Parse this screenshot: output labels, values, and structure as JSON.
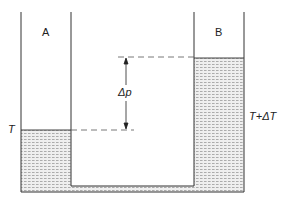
{
  "diagram": {
    "vessel_a": {
      "label": "A",
      "temperature_label": "T"
    },
    "vessel_b": {
      "label": "B",
      "temperature_label": "T+ΔT"
    },
    "pressure_difference": {
      "label": "Δp"
    },
    "colors": {
      "wall": "#333333",
      "liquid_fill": "#e6e6e6",
      "liquid_hatch": "#9a9a9a",
      "dashed_line": "#555555"
    }
  }
}
